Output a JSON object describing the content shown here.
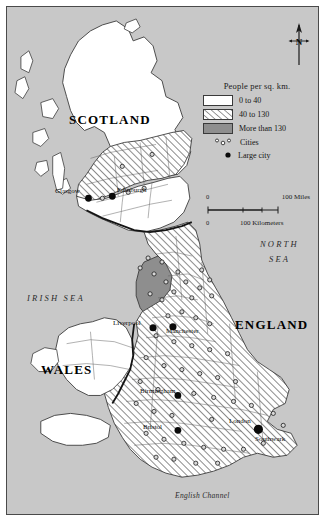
{
  "figure": {
    "background_color": "#c8c8c8",
    "frame_color": "#4a4a4a"
  },
  "legend": {
    "title": "People per sq. km.",
    "classes": [
      {
        "label": "0 to 40",
        "fill": "#ffffff",
        "pattern": "solid"
      },
      {
        "label": "40 to 130",
        "fill": "#ffffff",
        "pattern": "diagonal-hatch"
      },
      {
        "label": "More than 130",
        "fill": "#8e8e8e",
        "pattern": "solid"
      }
    ],
    "symbols": [
      {
        "label": "Cities",
        "symbol": "small-open-circles"
      },
      {
        "label": "Large city",
        "symbol": "large-filled-dot"
      }
    ]
  },
  "scale_bar": {
    "zero_top": "0",
    "zero_bottom": "0",
    "miles_label": "100 Miles",
    "kilometers_label": "100 Kilometers"
  },
  "compass": {
    "north_letter": "N"
  },
  "country_labels": [
    {
      "name": "SCOTLAND",
      "x": 62,
      "y": 112
    },
    {
      "name": "ENGLAND",
      "x": 228,
      "y": 317
    },
    {
      "name": "WALES",
      "x": 34,
      "y": 362
    }
  ],
  "sea_labels": [
    {
      "name": "NORTH",
      "x": 253,
      "y": 238
    },
    {
      "name": "SEA",
      "x": 262,
      "y": 253
    },
    {
      "name": "IRISH SEA",
      "x": 20,
      "y": 292
    }
  ],
  "channel_label": {
    "name": "English Channel",
    "x": 168,
    "y": 489
  },
  "cities": [
    {
      "name": "Glasgow",
      "label_x": 48,
      "label_y": 185,
      "dot_x": 82,
      "dot_y": 192,
      "type": "large"
    },
    {
      "name": "Edinburgh",
      "label_x": 110,
      "label_y": 184,
      "dot_x": 106,
      "dot_y": 190,
      "type": "large"
    },
    {
      "name": "Liverpool",
      "label_x": 106,
      "label_y": 317,
      "dot_x": 147,
      "dot_y": 322,
      "type": "large"
    },
    {
      "name": "Manchester",
      "label_x": 159,
      "label_y": 325,
      "dot_x": 167,
      "dot_y": 321,
      "type": "large"
    },
    {
      "name": "Birmingham",
      "label_x": 133,
      "label_y": 385,
      "dot_x": 172,
      "dot_y": 390,
      "type": "large"
    },
    {
      "name": "Bristol",
      "label_x": 136,
      "label_y": 421,
      "dot_x": 172,
      "dot_y": 425,
      "type": "large"
    },
    {
      "name": "London",
      "label_x": 222,
      "label_y": 415,
      "dot_x": 253,
      "dot_y": 424,
      "type": "large"
    },
    {
      "name": "Southwark",
      "label_x": 248,
      "label_y": 433,
      "dot_x": 253,
      "dot_y": 425,
      "type": "large"
    }
  ]
}
